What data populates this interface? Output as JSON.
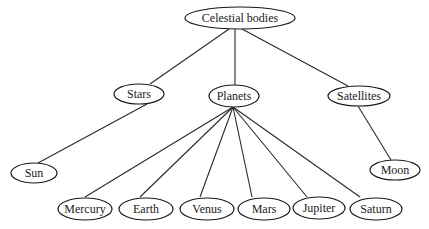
{
  "diagram": {
    "type": "tree",
    "root": {
      "label": "Celestial bodies",
      "children": [
        {
          "label": "Stars",
          "children": [
            {
              "label": "Sun"
            }
          ]
        },
        {
          "label": "Planets",
          "children": [
            {
              "label": "Mercury"
            },
            {
              "label": "Earth"
            },
            {
              "label": "Venus"
            },
            {
              "label": "Mars"
            },
            {
              "label": "Jupiter"
            },
            {
              "label": "Saturn"
            }
          ]
        },
        {
          "label": "Satellites",
          "children": [
            {
              "label": "Moon"
            }
          ]
        }
      ]
    },
    "nodes": {
      "celestial_bodies": "Celestial bodies",
      "stars": "Stars",
      "planets": "Planets",
      "satellites": "Satellites",
      "sun": "Sun",
      "moon": "Moon",
      "mercury": "Mercury",
      "earth": "Earth",
      "venus": "Venus",
      "mars": "Mars",
      "jupiter": "Jupiter",
      "saturn": "Saturn"
    },
    "edges": [
      [
        "Celestial bodies",
        "Stars"
      ],
      [
        "Celestial bodies",
        "Planets"
      ],
      [
        "Celestial bodies",
        "Satellites"
      ],
      [
        "Stars",
        "Sun"
      ],
      [
        "Satellites",
        "Moon"
      ],
      [
        "Planets",
        "Mercury"
      ],
      [
        "Planets",
        "Earth"
      ],
      [
        "Planets",
        "Venus"
      ],
      [
        "Planets",
        "Mars"
      ],
      [
        "Planets",
        "Jupiter"
      ],
      [
        "Planets",
        "Saturn"
      ]
    ]
  }
}
